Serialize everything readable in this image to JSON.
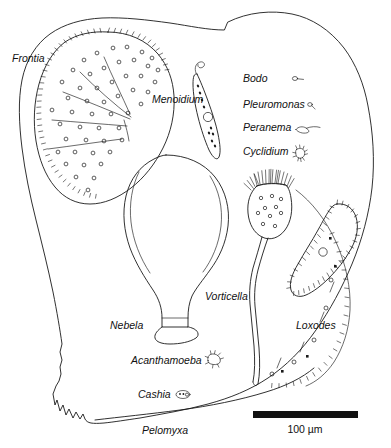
{
  "figure": {
    "background_color": "#ffffff",
    "ink_color": "#1a1a1a",
    "width": 391,
    "height": 448
  },
  "labels": {
    "frontia": "Frontia",
    "menoidium": "Menoidium",
    "bodo": "Bodo",
    "pleuromonas": "Pleuromonas",
    "peranema": "Peranema",
    "cyclidium": "Cyclidium",
    "vorticella": "Vorticella",
    "nebela": "Nebela",
    "loxodes": "Loxodes",
    "acanthamoeba": "Acanthamoeba",
    "cashia": "Cashia",
    "pelomyxa": "Pelomyxa"
  },
  "organisms": [
    {
      "name": "Frontia",
      "label": "Frontia",
      "type": "ciliate",
      "label_x": 12,
      "label_y": 62,
      "description": "large ovoid ciliate with marginal cilia fringe, scattered cortical granules and radiating curved lines"
    },
    {
      "name": "Menoidium",
      "label": "Menoidium",
      "type": "euglenoid flagellate",
      "label_x": 152,
      "label_y": 103,
      "description": "slender spindle-shaped cell with anterior flagellum, internal granules and a nucleus"
    },
    {
      "name": "Bodo",
      "label": "Bodo",
      "type": "kinetoplastid flagellate",
      "label_x": 243,
      "label_y": 82,
      "glyph_x": 296,
      "glyph_y": 79,
      "description": "tiny oval flagellate with a single trailing flagellum"
    },
    {
      "name": "Pleuromonas",
      "label": "Pleuromonas",
      "type": "flagellate",
      "label_x": 243,
      "label_y": 108,
      "glyph_x": 311,
      "glyph_y": 106,
      "description": "minute comma-shaped flagellate"
    },
    {
      "name": "Peranema",
      "label": "Peranema",
      "type": "euglenoid flagellate",
      "label_x": 243,
      "label_y": 131,
      "glyph_x": 300,
      "glyph_y": 129,
      "description": "small elongate flagellate with a thick anterior flagellum"
    },
    {
      "name": "Cyclidium",
      "label": "Cyclidium",
      "type": "ciliate",
      "label_x": 243,
      "label_y": 155,
      "glyph_x": 299,
      "glyph_y": 153,
      "description": "small ciliate with long caudal cilia"
    },
    {
      "name": "Vorticella",
      "label": "Vorticella",
      "type": "peritrich ciliate",
      "label_x": 205,
      "label_y": 300,
      "description": "bell-shaped ciliate with oral ciliary crown on a long contractile stalk"
    },
    {
      "name": "Nebela",
      "label": "Nebela",
      "type": "testate amoeba",
      "label_x": 110,
      "label_y": 329,
      "description": "flask-shaped shelled amoeba with narrow neck aperture"
    },
    {
      "name": "Loxodes",
      "label": "Loxodes",
      "type": "karyorelictean ciliate",
      "label_x": 296,
      "label_y": 329,
      "description": "crescent-shaped flattened ciliate with ventral cilia row and a nucleus"
    },
    {
      "name": "Acanthamoeba",
      "label": "Acanthamoeba",
      "type": "naked amoeba",
      "label_x": 131,
      "label_y": 364,
      "glyph_x": 207,
      "glyph_y": 360,
      "description": "small amoeba with fine spiny acanthopodia"
    },
    {
      "name": "Cashia",
      "label": "Cashia",
      "type": "naked amoeba",
      "label_x": 138,
      "label_y": 398,
      "glyph_x": 177,
      "glyph_y": 395,
      "description": "very small oval amoeba"
    },
    {
      "name": "Pelomyxa",
      "label": "Pelomyxa",
      "type": "giant amoeba",
      "label_x": 142,
      "label_y": 434,
      "description": "giant amoeba whose outline encloses the entire figure, with crenulated uroid at lower left"
    }
  ],
  "scale_bar": {
    "label": "100 µm",
    "length_px": 105,
    "x": 253,
    "y": 411,
    "height": 7,
    "label_x": 305,
    "label_y": 432,
    "color": "#111111"
  }
}
